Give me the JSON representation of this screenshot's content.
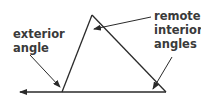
{
  "diagram": {
    "labels": {
      "exterior": [
        "exterior",
        "angle"
      ],
      "remote": [
        "remote",
        "interior",
        "angles"
      ]
    },
    "colors": {
      "line": "#2a2a2a",
      "text": "#3a3a3a",
      "background": "#ffffff"
    }
  }
}
